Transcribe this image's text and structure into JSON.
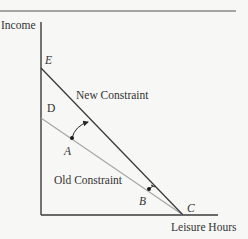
{
  "diagram": {
    "type": "budget-constraint",
    "y_axis_label": "Income",
    "x_axis_label": "Leisure Hours",
    "lines": {
      "new": {
        "label": "New Constraint",
        "from_point": "E",
        "to_point": "C",
        "color": "#3a3a3a"
      },
      "old": {
        "label": "Old Constraint",
        "from_point": "D",
        "to_point": "C",
        "color": "#a8a8a8"
      }
    },
    "points": {
      "E": "E",
      "D": "D",
      "A": "A",
      "B": "B",
      "C": "C"
    },
    "colors": {
      "background": "#f7f7f5",
      "axis": "#3a3a3a",
      "rule": "#555555"
    }
  }
}
